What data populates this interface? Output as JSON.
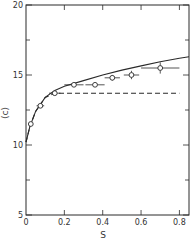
{
  "chart_data": {
    "type": "scatter",
    "title": "",
    "xlabel": "S",
    "ylabel": "⟨c⟩",
    "xlim": [
      0,
      0.85
    ],
    "ylim": [
      5,
      20
    ],
    "x_ticks": [
      0,
      0.2,
      0.4,
      0.6,
      0.8
    ],
    "x_tick_labels": [
      "0",
      "0.2",
      "0.4",
      "0.6",
      "0.8"
    ],
    "y_ticks": [
      5,
      10,
      15,
      20
    ],
    "y_tick_labels": [
      "5",
      "10",
      "15",
      "20"
    ],
    "grid": false,
    "legend": null,
    "series": [
      {
        "name": "data points",
        "kind": "scatter",
        "marker": "open-circle",
        "x": [
          0.025,
          0.075,
          0.15,
          0.25,
          0.36,
          0.45,
          0.55,
          0.7
        ],
        "y": [
          11.5,
          12.8,
          13.7,
          14.3,
          14.3,
          14.8,
          15.0,
          15.5
        ],
        "xerr": [
          0.01,
          0.02,
          0.03,
          0.05,
          0.05,
          0.04,
          0.04,
          0.1
        ],
        "yerr": [
          0,
          0,
          0,
          0,
          0,
          0.2,
          0.3,
          0.4
        ]
      },
      {
        "name": "solid curve",
        "kind": "line",
        "style": "solid",
        "x": [
          0.0,
          0.02,
          0.05,
          0.1,
          0.15,
          0.2,
          0.3,
          0.4,
          0.5,
          0.6,
          0.7,
          0.8,
          0.85
        ],
        "y": [
          10.2,
          11.3,
          12.4,
          13.4,
          13.9,
          14.2,
          14.6,
          15.0,
          15.35,
          15.65,
          15.95,
          16.2,
          16.3
        ]
      },
      {
        "name": "dashed curve",
        "kind": "line",
        "style": "dashed",
        "x": [
          0.0,
          0.02,
          0.05,
          0.1,
          0.15,
          0.2,
          0.4,
          0.6,
          0.8
        ],
        "y": [
          10.2,
          11.3,
          12.4,
          13.4,
          13.7,
          13.7,
          13.7,
          13.7,
          13.7
        ]
      }
    ]
  },
  "axes": {
    "xlabel": "S",
    "ylabel": "⟨c⟩",
    "x_tick_labels": [
      "0",
      "0.2",
      "0.4",
      "0.6",
      "0.8"
    ],
    "y_tick_labels": [
      "5",
      "10",
      "15",
      "20"
    ]
  }
}
